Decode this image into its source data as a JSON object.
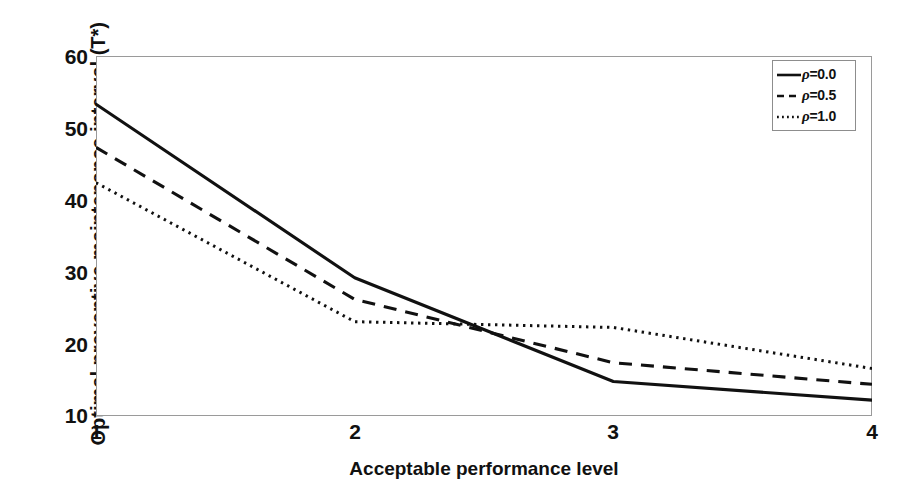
{
  "chart_data": {
    "type": "line",
    "title": "",
    "xlabel": "Acceptable performance level",
    "ylabel": "Optimal preventive maintenance interval (T*)",
    "x": [
      1,
      2,
      3,
      4
    ],
    "xlim": [
      1,
      4
    ],
    "ylim": [
      10,
      60
    ],
    "xticks": [
      "1",
      "2",
      "3",
      "4"
    ],
    "yticks": [
      "10",
      "20",
      "30",
      "40",
      "50",
      "60"
    ],
    "grid": false,
    "legend_position": "top-right",
    "series": [
      {
        "name": "ρ=0.0",
        "rho": "0.0",
        "style": "solid",
        "color": "#111111",
        "values": [
          53.3,
          29.2,
          14.8,
          12.2
        ]
      },
      {
        "name": "ρ=0.5",
        "rho": "0.5",
        "style": "dashed",
        "color": "#111111",
        "values": [
          47.3,
          26.2,
          17.4,
          14.4
        ]
      },
      {
        "name": "ρ=1.0",
        "rho": "1.0",
        "style": "dotted",
        "color": "#111111",
        "values": [
          42.4,
          23.1,
          22.3,
          16.6
        ]
      }
    ]
  },
  "axes": {
    "y_title": "Optimal preventive maintenance interval (T*)",
    "x_title": "Acceptable performance level",
    "y_tick_labels": [
      "60",
      "50",
      "40",
      "30",
      "20",
      "10"
    ],
    "x_tick_labels": [
      "1",
      "2",
      "3",
      "4"
    ]
  },
  "legend": {
    "items": [
      {
        "label": "ρ=0.0",
        "rho_symbol": "ρ",
        "value_text": "=0.0",
        "style": "solid"
      },
      {
        "label": "ρ=0.5",
        "rho_symbol": "ρ",
        "value_text": "=0.5",
        "style": "dashed"
      },
      {
        "label": "ρ=1.0",
        "rho_symbol": "ρ",
        "value_text": "=1.0",
        "style": "dotted"
      }
    ]
  },
  "colors": {
    "line": "#111111",
    "frame": "#9a9a9a",
    "background": "#ffffff"
  }
}
